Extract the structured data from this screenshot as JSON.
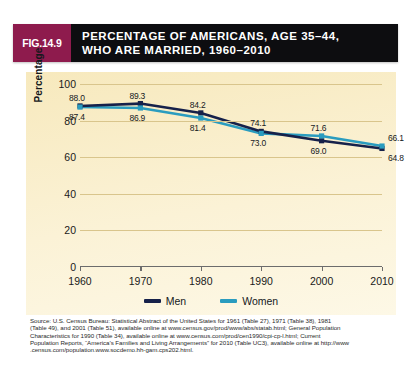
{
  "figure": {
    "label": "FIG.14.9",
    "title_line1": "PERCENTAGE OF AMERICANS, AGE 35–44,",
    "title_line2": "WHO ARE MARRIED, 1960–2010",
    "label_box_color": "#8e1b4d",
    "title_bar_color": "#0d0d10",
    "panel_color": "#f8ecc4"
  },
  "chart_data": {
    "type": "line",
    "title": "PERCENTAGE OF AMERICANS, AGE 35–44, WHO ARE MARRIED, 1960–2010",
    "xlabel": "",
    "ylabel": "Percentage",
    "categories": [
      "1960",
      "1970",
      "1980",
      "1990",
      "2000",
      "2010"
    ],
    "x": [
      1960,
      1970,
      1980,
      1990,
      2000,
      2010
    ],
    "ylim": [
      0,
      100
    ],
    "yticks": [
      0,
      20,
      40,
      60,
      80,
      100
    ],
    "grid": true,
    "legend_position": "bottom-center",
    "series": [
      {
        "name": "Men",
        "color": "#16214a",
        "values": [
          88.0,
          89.3,
          84.2,
          74.1,
          69.0,
          64.8
        ],
        "labels": [
          "88.0",
          "89.3",
          "84.2",
          "74.1",
          "69.0",
          "64.8"
        ]
      },
      {
        "name": "Women",
        "color": "#2a9cbf",
        "values": [
          87.4,
          86.9,
          81.4,
          73.0,
          71.6,
          66.1
        ],
        "labels": [
          "87.4",
          "86.9",
          "81.4",
          "73.0",
          "71.6",
          "66.1"
        ]
      }
    ]
  },
  "legend": {
    "items": [
      {
        "label": "Men",
        "color": "#16214a"
      },
      {
        "label": "Women",
        "color": "#2a9cbf"
      }
    ]
  },
  "source": {
    "line1": "Source: U.S. Census Bureau: Statistical Abstract of the United States for 1961 (Table 27), 1971 (Table 38), 1981",
    "line2": "(Table 49), and 2001 (Table 51), available online at www.census.gov/prod/www/abs/statab.html; General Population",
    "line3": "Characteristics for 1990 (Table 34), available online at www.census.com/prod/cen1990/cpi-cp-l.html; Current",
    "line4": "Population Reports, “America’s Families and Living Arrangements” for 2010 (Table UC3), available online at http://www",
    "line5": ".census.com/population.www.socdemo.hh-gam.cps202.html."
  }
}
